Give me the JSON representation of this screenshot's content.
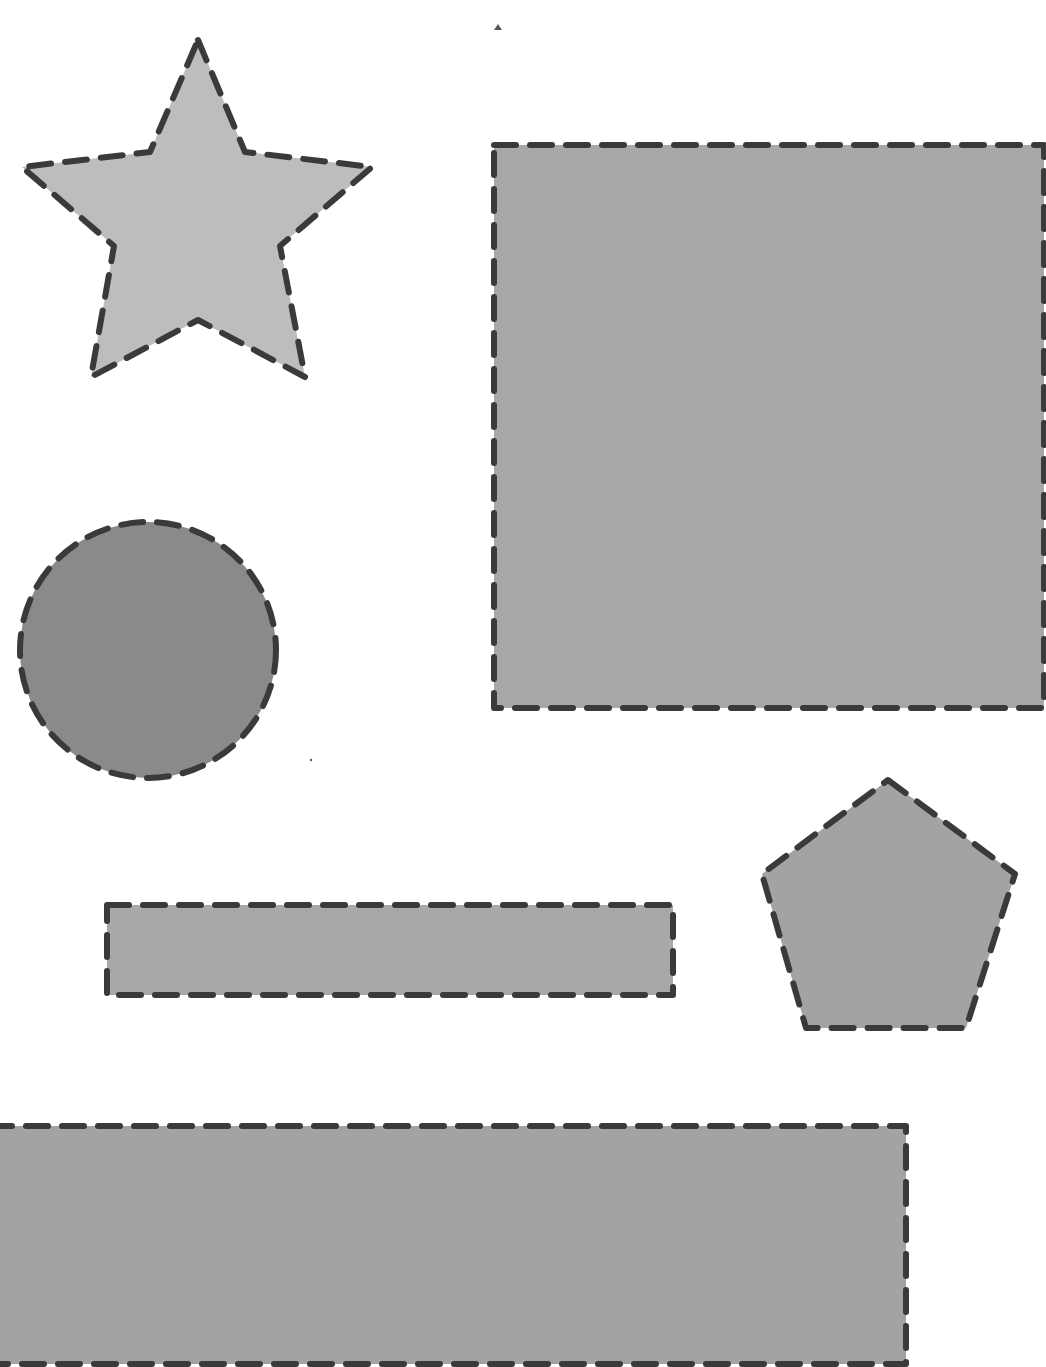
{
  "canvas": {
    "width": 1046,
    "height": 1367,
    "background": "#ffffff"
  },
  "style": {
    "stroke_color": "#3a3a3a",
    "stroke_width": 6,
    "dash": "22 14",
    "fill_light": "#bdbdbd",
    "fill_mid": "#a9a9a9",
    "fill_dark": "#8c8c8c"
  },
  "shapes": {
    "star": {
      "kind": "star",
      "points": "198,40 245,152 372,167 280,246 305,377 198,320 91,377 114,246 22,167 150,152",
      "fill": "#bdbdbd"
    },
    "large_square": {
      "kind": "rectangle",
      "x": 494,
      "y": 145,
      "width": 550,
      "height": 563,
      "fill": "#a8a8a8"
    },
    "circle": {
      "kind": "circle",
      "cx": 148,
      "cy": 650,
      "r": 128,
      "fill": "#8a8a8a"
    },
    "thin_rectangle": {
      "kind": "rectangle",
      "x": 107,
      "y": 905,
      "width": 566,
      "height": 90,
      "fill": "#a8a8a8"
    },
    "pentagon": {
      "kind": "pentagon",
      "points": "888,780 1015,874 966,1028 806,1028 762,874",
      "fill": "#a3a3a3"
    },
    "wide_rectangle": {
      "kind": "rectangle",
      "x": -10,
      "y": 1126,
      "width": 916,
      "height": 238,
      "fill": "#a3a3a3"
    }
  },
  "artifacts": {
    "small_triangle": {
      "points": "494,30 498,24 502,30"
    },
    "dot": {
      "cx": 311,
      "cy": 760,
      "r": 1.2
    }
  }
}
